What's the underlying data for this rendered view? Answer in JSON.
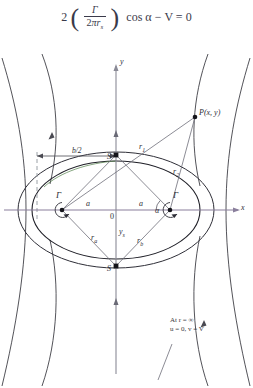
{
  "equation": {
    "lead": "2",
    "paren_open": "(",
    "paren_close": ")",
    "frac_top": "Γ",
    "frac_bottom_coef": "2",
    "frac_bottom_pi": "π",
    "frac_bottom_r": "r",
    "frac_bottom_sub": "s",
    "tail": "cos α  −  V = 0"
  },
  "axes": {
    "x_label": "x",
    "y_label": "y",
    "origin_label": "0"
  },
  "labels": {
    "point_p": "P(x, y)",
    "stagnation_top": "S",
    "stagnation_bottom": "S",
    "vortex_left": "Γ",
    "vortex_right": "Γ",
    "half_width": "b/2",
    "semi_axis_left": "a",
    "semi_axis_right": "a",
    "radius_1": "r",
    "radius_1_sub": "1",
    "radius_2": "r",
    "radius_2_sub": "2",
    "radius_a": "r",
    "radius_a_sub": "a",
    "radius_b": "r",
    "radius_b_sub": "b",
    "y_stagnation": "y",
    "y_stagnation_sub": "s",
    "angle_alpha": "α"
  },
  "annotation": {
    "line1": "At r = ∞",
    "line2": "u = 0, v = V"
  },
  "colors": {
    "stream": "#3f3f46",
    "body": "#1f1f27",
    "axis_x": "#8a7f9c",
    "axis_y": "#8a8a96",
    "ray": "#6e6e7a",
    "dashed": "#9aa0a6",
    "text": "#2d2d36",
    "accent_green": "#4a7a42"
  },
  "geometry": {
    "origin_x": 116,
    "origin_y": 166,
    "vortex_left_x": 62,
    "vortex_right_x": 170,
    "stag_top_y": 111,
    "stag_bottom_y": 222,
    "point_p_x": 195,
    "point_p_y": 73
  }
}
